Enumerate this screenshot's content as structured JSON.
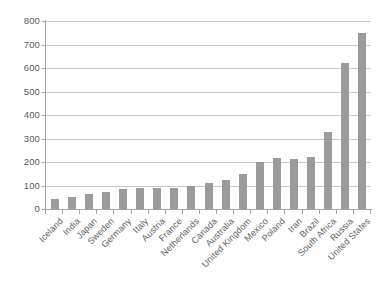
{
  "chart_data": {
    "type": "bar",
    "title": "",
    "subtitle": "",
    "xlabel": "",
    "ylabel": "",
    "ylim": [
      0,
      800
    ],
    "ytick_step": 100,
    "yticks": [
      0,
      100,
      200,
      300,
      400,
      500,
      600,
      700,
      800
    ],
    "ytick_labels": [
      "0",
      "100",
      "200",
      "300",
      "400",
      "500",
      "600",
      "700",
      "800"
    ],
    "grid": true,
    "grid_axis": "y",
    "legend": false,
    "legend_position": "none",
    "bar_color": "#9b9b9b",
    "grid_color": "#c8c8c8",
    "axis_color": "#a6a6a6",
    "background_color": "#ffffff",
    "label_color": "#5e5e5e",
    "xtick_rotation": -45,
    "categories": [
      "Iceland",
      "India",
      "Japan",
      "Sweden",
      "Germany",
      "Italy",
      "Austria",
      "France",
      "Netherlands",
      "Canada",
      "Australia",
      "United Kingdom",
      "Mexico",
      "Poland",
      "Iran",
      "Brazil",
      "South Africa",
      "Russia",
      "United States"
    ],
    "values": [
      42,
      51,
      62,
      72,
      85,
      88,
      91,
      90,
      96,
      110,
      124,
      148,
      201,
      215,
      214,
      220,
      328,
      621,
      747
    ]
  }
}
